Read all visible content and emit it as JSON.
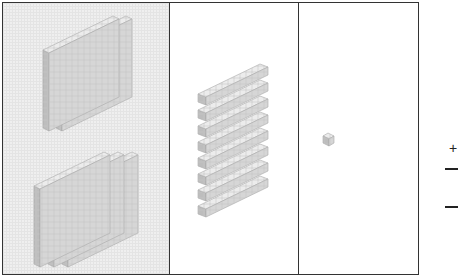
{
  "diagram": {
    "type": "base-ten-blocks",
    "columns": [
      {
        "name": "hundreds",
        "groups": [
          {
            "flats": 2
          },
          {
            "flats": 3
          }
        ],
        "shaded": true
      },
      {
        "name": "tens",
        "rods": 8
      },
      {
        "name": "ones",
        "units": 1
      }
    ],
    "side_symbols": {
      "plus": "+",
      "lines": 2
    },
    "colors": {
      "block_face": "#d6d6d6",
      "block_top": "#ececec",
      "block_side": "#bdbdbd",
      "border": "#333333",
      "hundreds_bg": "#efefef"
    }
  }
}
